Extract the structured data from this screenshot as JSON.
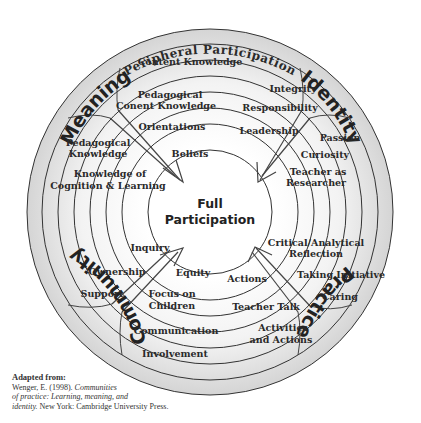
{
  "diagram": {
    "title_outer": "Peripheral Participation",
    "center": {
      "line1": "Full",
      "line2": "Participation"
    },
    "quadrants": {
      "meaning": "Meaning",
      "identity": "Identity",
      "community": "Community",
      "practice": "Practice"
    },
    "labels": {
      "meaning": [
        "Content Knowledge",
        "Pedagogical",
        "Conent Knowledge",
        "Orientations",
        "Pedagogical",
        "Knowledge",
        "Beliefs",
        "Knowledge of",
        "Cognition & Learning"
      ],
      "identity": [
        "Integrity",
        "Responsibility",
        "Leadership",
        "Passion",
        "Curiosity",
        "Teacher as",
        "Researcher"
      ],
      "community": [
        "Inquiry",
        "Ownership",
        "Equity",
        "Support",
        "Focus on",
        "Children",
        "Communication",
        "Involvement"
      ],
      "practice": [
        "Critical/Analytical",
        "Reflection",
        "Actions",
        "Taking Initiative",
        "Caring",
        "Teacher Talk",
        "Activities",
        "and Actions"
      ]
    },
    "colors": {
      "ring_fill": "#e4e4e4",
      "ring_stroke": "#333333",
      "center_fill": "#ffffff"
    }
  },
  "citation": {
    "heading": "Adapted from:",
    "line1_plain": "Wenger, E. (1998). ",
    "line1_italic": "Communities",
    "line2_italic": "of practice: Learning, meaning, and",
    "line3_italic": "identity.",
    "line3_plain": " New York: Cambridge University Press."
  }
}
